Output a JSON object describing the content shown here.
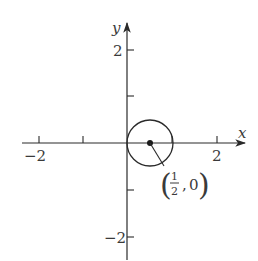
{
  "diagram": {
    "type": "coordinate-plane",
    "axes": {
      "x_label": "x",
      "y_label": "y",
      "x_ticks": [
        {
          "value": -2,
          "label": "−2"
        },
        {
          "value": -1,
          "label": ""
        },
        {
          "value": 1,
          "label": ""
        },
        {
          "value": 2,
          "label": "2"
        }
      ],
      "y_ticks": [
        {
          "value": 2,
          "label": "2"
        },
        {
          "value": 1,
          "label": ""
        },
        {
          "value": -1,
          "label": ""
        },
        {
          "value": -2,
          "label": "−2"
        }
      ]
    },
    "circle": {
      "center_x": 0.5,
      "center_y": 0,
      "radius": 0.5
    },
    "annotation": {
      "open_paren": "(",
      "numerator": "1",
      "denominator": "2",
      "separator": ",",
      "y_value": "0",
      "close_paren": ")"
    }
  },
  "colors": {
    "ink": "#2a2a2a",
    "background": "#ffffff"
  }
}
